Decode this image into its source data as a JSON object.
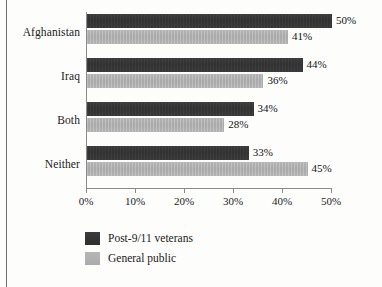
{
  "chart_data": {
    "type": "bar",
    "orientation": "horizontal",
    "title": "",
    "xlabel": "",
    "ylabel": "",
    "categories": [
      "Afghanistan",
      "Iraq",
      "Both",
      "Neither"
    ],
    "series": [
      {
        "name": "Post-9/11 veterans",
        "color": "#343434",
        "values": [
          50,
          44,
          34,
          33
        ],
        "labels": [
          "50%",
          "44%",
          "34%",
          "33%"
        ]
      },
      {
        "name": "General public",
        "color": "#b0b0b0",
        "values": [
          41,
          36,
          28,
          45
        ],
        "labels": [
          "41%",
          "36%",
          "28%",
          "45%"
        ]
      }
    ],
    "xlim": [
      0,
      50
    ],
    "xticks": [
      0,
      10,
      20,
      30,
      40,
      50
    ],
    "xtick_labels": [
      "0%",
      "10%",
      "20%",
      "30%",
      "40%",
      "50%"
    ],
    "grid": false,
    "legend_position": "bottom-left",
    "value_labels_shown": true
  },
  "axis": {
    "ticks": [
      {
        "label": "0%",
        "value": 0
      },
      {
        "label": "10%",
        "value": 10
      },
      {
        "label": "20%",
        "value": 20
      },
      {
        "label": "30%",
        "value": 30
      },
      {
        "label": "40%",
        "value": 40
      },
      {
        "label": "50%",
        "value": 50
      }
    ]
  },
  "categories": [
    {
      "label": "Afghanistan"
    },
    {
      "label": "Iraq"
    },
    {
      "label": "Both"
    },
    {
      "label": "Neither"
    }
  ],
  "bars": [
    {
      "category": "Afghanistan",
      "series": "Post-9/11 veterans",
      "value": 50,
      "label": "50%"
    },
    {
      "category": "Afghanistan",
      "series": "General public",
      "value": 41,
      "label": "41%"
    },
    {
      "category": "Iraq",
      "series": "Post-9/11 veterans",
      "value": 44,
      "label": "44%"
    },
    {
      "category": "Iraq",
      "series": "General public",
      "value": 36,
      "label": "36%"
    },
    {
      "category": "Both",
      "series": "Post-9/11 veterans",
      "value": 34,
      "label": "34%"
    },
    {
      "category": "Both",
      "series": "General public",
      "value": 28,
      "label": "28%"
    },
    {
      "category": "Neither",
      "series": "Post-9/11 veterans",
      "value": 33,
      "label": "33%"
    },
    {
      "category": "Neither",
      "series": "General public",
      "value": 45,
      "label": "45%"
    }
  ],
  "legend": {
    "items": [
      {
        "label": "Post-9/11 veterans",
        "color": "#343434"
      },
      {
        "label": "General public",
        "color": "#b0b0b0"
      }
    ]
  }
}
